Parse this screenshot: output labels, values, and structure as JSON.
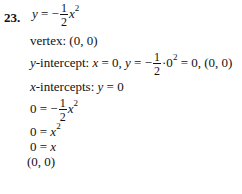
{
  "problem": {
    "number": "23.",
    "equation": {
      "lhs": "y",
      "eq": " = −",
      "num": "1",
      "den": "2",
      "var": "x",
      "exp": "2"
    },
    "vertex": {
      "label": "vertex: ",
      "value": "(0, 0)"
    },
    "y_intercept": {
      "label_var": "y",
      "label_rest": "-intercept: ",
      "x_var": "x",
      "x_rest": " = 0,  ",
      "y_var": "y",
      "eq": " = −",
      "num": "1",
      "den": "2",
      "after_frac": "·0",
      "exp": "2",
      "result": " = 0,  (0, 0)"
    },
    "x_intercepts": {
      "label_var": "x",
      "label_rest": "-intercepts: ",
      "y_var": "y",
      "rest": " = 0"
    },
    "steps": [
      {
        "lhs": "0 = −",
        "num": "1",
        "den": "2",
        "var": "x",
        "exp": "2"
      },
      {
        "lhs": "0 = ",
        "var": "x",
        "exp": "2"
      },
      {
        "lhs": "0 = ",
        "var": "x"
      },
      {
        "text": "(0, 0)"
      }
    ]
  }
}
